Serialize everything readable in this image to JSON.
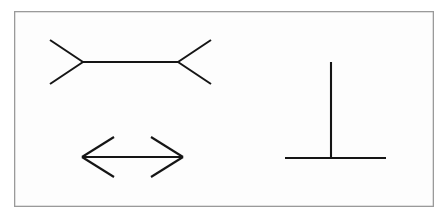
{
  "figure": {
    "title": "Muller-Lyer and vertical-horizontal illusion figure",
    "background_color": "#ffffff",
    "panel_fill": "#fdfdfd",
    "border_color": "#9a9a9a",
    "stroke_color": "#151515",
    "stroke_width": 2.1,
    "border_width": 1.3,
    "frame": {
      "x": 14,
      "y": 11,
      "width": 420,
      "height": 196
    }
  },
  "chart_data": {
    "type": "diagram",
    "title": "Muller-Lyer and vertical-horizontal illusion figure",
    "xlabel": "",
    "ylabel": "",
    "grid": false,
    "legend": "none",
    "xlim": [
      0,
      448
    ],
    "ylim": [
      0,
      217
    ],
    "shapes": [
      {
        "name": "muller-lyer-fins-out",
        "label": "Muller-Lyer figure with outward fins (appears longer)",
        "shaft": {
          "x1": 83,
          "y1": 62,
          "x2": 178,
          "y2": 62,
          "length": 95
        },
        "fins": [
          {
            "x1": 83,
            "y1": 62,
            "x2": 50,
            "y2": 40
          },
          {
            "x1": 83,
            "y1": 62,
            "x2": 50,
            "y2": 84
          },
          {
            "x1": 178,
            "y1": 62,
            "x2": 211,
            "y2": 40
          },
          {
            "x1": 178,
            "y1": 62,
            "x2": 211,
            "y2": 84
          }
        ]
      },
      {
        "name": "muller-lyer-fins-in",
        "label": "Muller-Lyer figure with inward fins, double-headed arrow (appears shorter)",
        "shaft": {
          "x1": 82,
          "y1": 157,
          "x2": 183,
          "y2": 157,
          "length": 101
        },
        "fins": [
          {
            "x1": 82,
            "y1": 157,
            "x2": 114,
            "y2": 137
          },
          {
            "x1": 82,
            "y1": 157,
            "x2": 114,
            "y2": 177
          },
          {
            "x1": 183,
            "y1": 157,
            "x2": 151,
            "y2": 137
          },
          {
            "x1": 183,
            "y1": 157,
            "x2": 151,
            "y2": 177
          }
        ]
      },
      {
        "name": "vertical-horizontal-illusion",
        "label": "Inverted-T vertical-horizontal illusion",
        "vertical": {
          "x1": 331,
          "y1": 62,
          "x2": 331,
          "y2": 158,
          "length": 96
        },
        "horizontal": {
          "x1": 285,
          "y1": 158,
          "x2": 386,
          "y2": 158,
          "length": 101
        }
      }
    ]
  }
}
